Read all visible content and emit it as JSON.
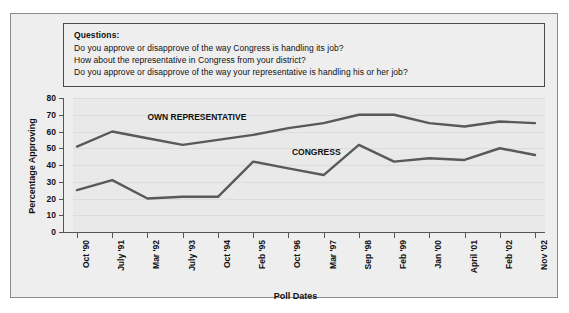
{
  "questions": {
    "heading": "Questions:",
    "lines": [
      "Do you approve or disapprove of the way Congress is handling its job?",
      "How about the representative in Congress from your district?",
      "Do you approve or disapprove of the way your representative is handling his or her job?"
    ]
  },
  "chart_data": {
    "type": "line",
    "title": "",
    "xlabel": "Poll Dates",
    "ylabel": "Percentage Approving",
    "ylim": [
      0,
      80
    ],
    "yticks": [
      0,
      10,
      20,
      30,
      40,
      50,
      60,
      70,
      80
    ],
    "grid": true,
    "legend_position": "inline-labels",
    "categories": [
      "Oct '90",
      "July '91",
      "Mar '92",
      "July '93",
      "Oct '94",
      "Feb '95",
      "Oct '96",
      "Mar '97",
      "Sep '98",
      "Feb '99",
      "Jan '00",
      "April '01",
      "Feb '02",
      "Nov '02"
    ],
    "series": [
      {
        "name": "OWN REPRESENTATIVE",
        "color": "#595959",
        "values": [
          51,
          60,
          56,
          52,
          55,
          58,
          62,
          65,
          70,
          70,
          65,
          63,
          66,
          65
        ]
      },
      {
        "name": "CONGRESS",
        "color": "#595959",
        "values": [
          25,
          31,
          20,
          21,
          21,
          42,
          38,
          34,
          52,
          42,
          44,
          43,
          50,
          46
        ]
      }
    ],
    "annotations": [
      {
        "text": "OWN REPRESENTATIVE",
        "x_index": 2.0,
        "y_value": 68
      },
      {
        "text": "CONGRESS",
        "x_index": 6.1,
        "y_value": 47
      }
    ]
  },
  "colors": {
    "panel_background": "#eeeeee",
    "plot_background": "#e9e9e9",
    "line": "#595959",
    "border": "#8c8c8c",
    "question_border": "#4a4a4a",
    "axis": "#555555",
    "gridline": "#dcdcdc",
    "text": "#111111"
  }
}
